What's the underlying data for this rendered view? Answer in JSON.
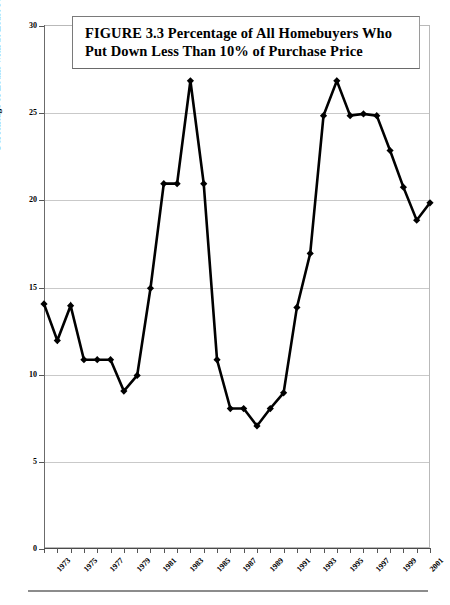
{
  "figure": {
    "title_line_1": "FIGURE 3.3  Percentage of All Homebuyers Who",
    "title_line_2": "Put Down Less Than 10% of Purchase Price"
  },
  "colors": {
    "series": "#000000",
    "gridline": "#c9c9c9",
    "frame": "#b9b9b9",
    "axis": "#555555",
    "title_border": "#7a7a7a",
    "background": "#ffffff"
  },
  "chart_data": {
    "type": "line",
    "title": "FIGURE 3.3  Percentage of All Homebuyers Who Put Down Less Than 10% of Purchase Price",
    "xlabel": "",
    "ylabel": "Percentage of Loans with at Least 90% Loan to Value Ratio",
    "ylim": [
      0,
      30
    ],
    "ytick_labels": [
      "30",
      "25",
      "20",
      "15",
      "10",
      "5",
      "0"
    ],
    "ytick_values": [
      30,
      25,
      20,
      15,
      10,
      5,
      0
    ],
    "xlim": [
      1973,
      2002
    ],
    "xtick_labels": [
      "1973",
      "1975",
      "1977",
      "1979",
      "1981",
      "1983",
      "1985",
      "1987",
      "1989",
      "1991",
      "1993",
      "1995",
      "1997",
      "1999",
      "2001"
    ],
    "grid": true,
    "legend": "none",
    "marker": "diamond",
    "categories": [
      1973,
      1974,
      1975,
      1976,
      1977,
      1978,
      1979,
      1980,
      1981,
      1982,
      1983,
      1984,
      1985,
      1986,
      1987,
      1988,
      1989,
      1990,
      1991,
      1992,
      1993,
      1994,
      1995,
      1996,
      1997,
      1998,
      1999,
      2000,
      2001,
      2002
    ],
    "values": [
      14.0,
      11.9,
      13.9,
      10.8,
      10.8,
      10.8,
      9.0,
      9.9,
      14.9,
      20.9,
      20.9,
      26.8,
      20.9,
      10.8,
      8.0,
      8.0,
      7.0,
      8.0,
      8.9,
      13.8,
      16.9,
      24.8,
      26.8,
      24.8,
      24.9,
      24.8,
      22.8,
      20.7,
      18.8,
      19.8
    ],
    "series": [
      {
        "name": "Percentage of Loans with at Least 90% Loan to Value Ratio",
        "values": [
          14.0,
          11.9,
          13.9,
          10.8,
          10.8,
          10.8,
          9.0,
          9.9,
          14.9,
          20.9,
          20.9,
          26.8,
          20.9,
          10.8,
          8.0,
          8.0,
          7.0,
          8.0,
          8.9,
          13.8,
          16.9,
          24.8,
          26.8,
          24.8,
          24.9,
          24.8,
          22.8,
          20.7,
          18.8,
          19.8
        ]
      }
    ]
  }
}
